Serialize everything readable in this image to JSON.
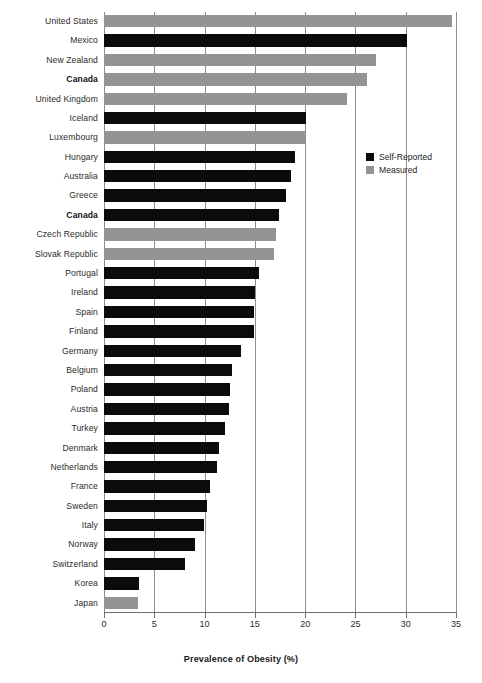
{
  "chart_data": {
    "type": "bar",
    "orientation": "horizontal",
    "title": "",
    "xlabel": "Prevalence of Obesity (%)",
    "ylabel": "",
    "xlim": [
      0,
      35
    ],
    "xticks": [
      0,
      5,
      10,
      15,
      20,
      25,
      30,
      35
    ],
    "grid": "vertical",
    "legend_position": "inside-right",
    "legend": [
      {
        "name": "Self-Reported",
        "color": "#0b0b0b"
      },
      {
        "name": "Measured",
        "color": "#949494"
      }
    ],
    "categories": [
      "United States",
      "Mexico",
      "New Zealand",
      "Canada",
      "United Kingdom",
      "Iceland",
      "Luxembourg",
      "Hungary",
      "Australia",
      "Greece",
      "Canada",
      "Czech Republic",
      "Slovak Republic",
      "Portugal",
      "Ireland",
      "Spain",
      "Finland",
      "Germany",
      "Belgium",
      "Poland",
      "Austria",
      "Turkey",
      "Denmark",
      "Netherlands",
      "France",
      "Sweden",
      "Italy",
      "Norway",
      "Switzerland",
      "Korea",
      "Japan"
    ],
    "values": [
      34.6,
      30.1,
      27.0,
      26.2,
      24.2,
      20.1,
      20.0,
      19.0,
      18.6,
      18.1,
      17.4,
      17.1,
      16.9,
      15.4,
      15.0,
      14.9,
      14.9,
      13.6,
      12.7,
      12.5,
      12.4,
      12.0,
      11.4,
      11.2,
      10.5,
      10.2,
      9.9,
      9.0,
      8.1,
      3.5,
      3.4
    ],
    "series_of_point": [
      "Measured",
      "Self-Reported",
      "Measured",
      "Measured",
      "Measured",
      "Self-Reported",
      "Measured",
      "Self-Reported",
      "Self-Reported",
      "Self-Reported",
      "Self-Reported",
      "Measured",
      "Measured",
      "Self-Reported",
      "Self-Reported",
      "Self-Reported",
      "Self-Reported",
      "Self-Reported",
      "Self-Reported",
      "Self-Reported",
      "Self-Reported",
      "Self-Reported",
      "Self-Reported",
      "Self-Reported",
      "Self-Reported",
      "Self-Reported",
      "Self-Reported",
      "Self-Reported",
      "Self-Reported",
      "Self-Reported",
      "Measured"
    ],
    "emphasized_categories": [
      "Canada"
    ]
  }
}
